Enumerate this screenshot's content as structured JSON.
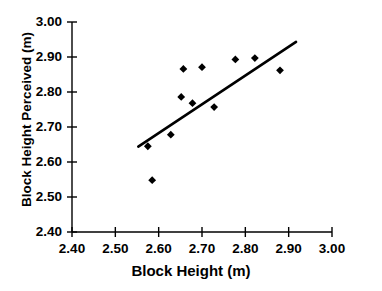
{
  "chart_data": {
    "type": "scatter",
    "title": "",
    "xlabel": "Block Height (m)",
    "ylabel": "Block Height Perceived (m)",
    "xlim": [
      2.4,
      3.0
    ],
    "ylim": [
      2.4,
      3.0
    ],
    "xticks": [
      "2.40",
      "2.50",
      "2.60",
      "2.70",
      "2.80",
      "2.90",
      "3.00"
    ],
    "yticks": [
      "2.40",
      "2.50",
      "2.60",
      "2.70",
      "2.80",
      "2.90",
      "3.00"
    ],
    "xtick_values": [
      2.4,
      2.5,
      2.6,
      2.7,
      2.8,
      2.9,
      3.0
    ],
    "ytick_values": [
      2.4,
      2.5,
      2.6,
      2.7,
      2.8,
      2.9,
      3.0
    ],
    "grid": false,
    "legend": false,
    "marker": "diamond",
    "marker_color": "#000000",
    "series": [
      {
        "name": "Block height perceived vs actual",
        "points": [
          {
            "x": 2.575,
            "y": 2.645
          },
          {
            "x": 2.585,
            "y": 2.548
          },
          {
            "x": 2.628,
            "y": 2.678
          },
          {
            "x": 2.652,
            "y": 2.786
          },
          {
            "x": 2.657,
            "y": 2.866
          },
          {
            "x": 2.678,
            "y": 2.768
          },
          {
            "x": 2.7,
            "y": 2.871
          },
          {
            "x": 2.728,
            "y": 2.757
          },
          {
            "x": 2.777,
            "y": 2.893
          },
          {
            "x": 2.822,
            "y": 2.897
          },
          {
            "x": 2.88,
            "y": 2.862
          }
        ]
      }
    ],
    "trendline": {
      "name": "linear fit",
      "color": "#000000",
      "width": 2.6,
      "x_start": 2.553,
      "y_start": 2.644,
      "x_end": 2.917,
      "y_end": 2.943
    }
  }
}
